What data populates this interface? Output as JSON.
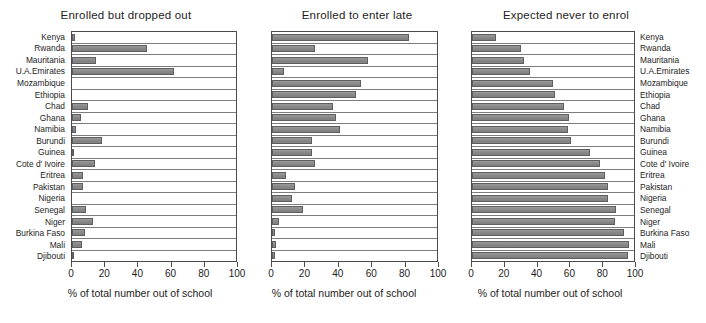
{
  "figure": {
    "axis_label": "% of total number out of school",
    "xticks": [
      "0",
      "20",
      "40",
      "60",
      "80",
      "100"
    ],
    "bar_color": "#8d8d8d",
    "frame_color": "#4a4a4a"
  },
  "chart_data": [
    {
      "type": "bar",
      "orientation": "horizontal",
      "title": "Enrolled but dropped out",
      "xlabel": "% of total number out of school",
      "ylabel": "",
      "xlim": [
        0,
        100
      ],
      "grid": false,
      "legend": "none",
      "categories": [
        "Kenya",
        "Rwanda",
        "Mauritania",
        "U.A.Emirates",
        "Mozambique",
        "Ethiopia",
        "Chad",
        "Ghana",
        "Namibia",
        "Burundi",
        "Guinea",
        "Cote d' Ivoire",
        "Eritrea",
        "Pakistan",
        "Nigeria",
        "Senegal",
        "Niger",
        "Burkina Faso",
        "Mali",
        "Djibouti"
      ],
      "values": [
        2,
        46,
        14.5,
        62,
        0,
        0,
        10,
        5.5,
        2.5,
        18,
        1.5,
        14,
        7,
        7,
        0,
        8.5,
        13,
        8,
        6,
        1
      ]
    },
    {
      "type": "bar",
      "orientation": "horizontal",
      "title": "Enrolled to enter late",
      "xlabel": "% of total number out of school",
      "ylabel": "",
      "xlim": [
        0,
        100
      ],
      "grid": false,
      "legend": "none",
      "categories": [
        "Kenya",
        "Rwanda",
        "Mauritania",
        "U.A.Emirates",
        "Mozambique",
        "Ethiopia",
        "Chad",
        "Ghana",
        "Namibia",
        "Burundi",
        "Guinea",
        "Cote d' Ivoire",
        "Eritrea",
        "Pakistan",
        "Nigeria",
        "Senegal",
        "Niger",
        "Burkina Faso",
        "Mali",
        "Djibouti"
      ],
      "values": [
        83,
        26,
        58,
        7.5,
        54,
        51,
        37,
        39,
        41,
        24,
        24,
        26,
        8.5,
        14,
        12,
        19,
        4,
        2,
        2.5,
        1.7
      ]
    },
    {
      "type": "bar",
      "orientation": "horizontal",
      "title": "Expected never to enrol",
      "xlabel": "% of total number out of school",
      "ylabel": "",
      "xlim": [
        0,
        100
      ],
      "grid": false,
      "legend": "none",
      "categories": [
        "Kenya",
        "Rwanda",
        "Mauritania",
        "U.A.Emirates",
        "Mozambique",
        "Ethiopia",
        "Chad",
        "Ghana",
        "Namibia",
        "Burundi",
        "Guinea",
        "Cote d' Ivoire",
        "Eritrea",
        "Pakistan",
        "Nigeria",
        "Senegal",
        "Niger",
        "Burkina Faso",
        "Mali",
        "Djibouti"
      ],
      "values": [
        15,
        30,
        32,
        36,
        50,
        51,
        57,
        60,
        59,
        61,
        73,
        79,
        82,
        84,
        84,
        89,
        88,
        94,
        97,
        96
      ]
    }
  ]
}
